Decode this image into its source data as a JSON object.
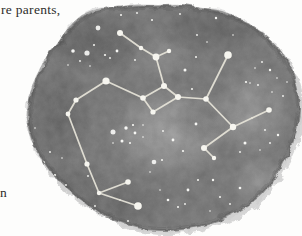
{
  "page": {
    "background": "#fdfdfc",
    "ink_color": "#2e2d2b",
    "text_fragments": [
      {
        "id": "top-margin-text",
        "text": "re parents,"
      },
      {
        "id": "left-margin-text",
        "text": "n"
      }
    ]
  },
  "illustration": {
    "type": "constellation-watercolor-wash",
    "canvas": {
      "width": 302,
      "height": 236
    },
    "wash": {
      "base_color": "#7a7a7a",
      "edge_color": "#5a5a5a",
      "dark_color": "#474747",
      "light_color": "#b9b9b9",
      "underwash_color": "#cccccc",
      "outline": [
        [
          57,
          44
        ],
        [
          68,
          28
        ],
        [
          82,
          15
        ],
        [
          97,
          9
        ],
        [
          115,
          7
        ],
        [
          135,
          5
        ],
        [
          158,
          5
        ],
        [
          180,
          5
        ],
        [
          203,
          8
        ],
        [
          222,
          11
        ],
        [
          238,
          18
        ],
        [
          254,
          28
        ],
        [
          270,
          41
        ],
        [
          282,
          55
        ],
        [
          291,
          71
        ],
        [
          296,
          88
        ],
        [
          298,
          106
        ],
        [
          296,
          124
        ],
        [
          291,
          142
        ],
        [
          284,
          158
        ],
        [
          274,
          176
        ],
        [
          261,
          192
        ],
        [
          245,
          205
        ],
        [
          228,
          214
        ],
        [
          209,
          221
        ],
        [
          188,
          226
        ],
        [
          166,
          228
        ],
        [
          145,
          227
        ],
        [
          124,
          222
        ],
        [
          104,
          214
        ],
        [
          86,
          203
        ],
        [
          68,
          189
        ],
        [
          52,
          173
        ],
        [
          40,
          156
        ],
        [
          31,
          139
        ],
        [
          27,
          122
        ],
        [
          28,
          104
        ],
        [
          32,
          86
        ],
        [
          40,
          68
        ],
        [
          48,
          54
        ]
      ],
      "shading": [
        {
          "kind": "light",
          "x": 168,
          "y": 132,
          "rx": 62,
          "ry": 46,
          "opacity": 0.75
        },
        {
          "kind": "light",
          "x": 252,
          "y": 112,
          "rx": 40,
          "ry": 48,
          "opacity": 0.55
        },
        {
          "kind": "light",
          "x": 160,
          "y": 58,
          "rx": 36,
          "ry": 24,
          "opacity": 0.3
        },
        {
          "kind": "light",
          "x": 262,
          "y": 182,
          "rx": 32,
          "ry": 26,
          "opacity": 0.5
        },
        {
          "kind": "dark",
          "x": 95,
          "y": 42,
          "rx": 58,
          "ry": 34,
          "opacity": 0.5
        },
        {
          "kind": "dark",
          "x": 58,
          "y": 115,
          "rx": 36,
          "ry": 55,
          "opacity": 0.4
        },
        {
          "kind": "dark",
          "x": 213,
          "y": 28,
          "rx": 60,
          "ry": 26,
          "opacity": 0.45
        },
        {
          "kind": "dark",
          "x": 118,
          "y": 205,
          "rx": 55,
          "ry": 26,
          "opacity": 0.35
        },
        {
          "kind": "dark",
          "x": 196,
          "y": 122,
          "rx": 26,
          "ry": 20,
          "opacity": 0.28
        },
        {
          "kind": "dark",
          "x": 70,
          "y": 185,
          "rx": 40,
          "ry": 25,
          "opacity": 0.3
        }
      ]
    },
    "constellation": {
      "line_color": "#e8e5da",
      "line_width": 1.7,
      "node_color": "#f6f5ef",
      "nodes": [
        {
          "id": "F",
          "x": 120,
          "y": 33,
          "r": 3.0
        },
        {
          "id": "F2",
          "x": 141,
          "y": 48,
          "r": 2.2
        },
        {
          "id": "E",
          "x": 156,
          "y": 57,
          "r": 3.4
        },
        {
          "id": "E2",
          "x": 169,
          "y": 51,
          "r": 2.2
        },
        {
          "id": "D",
          "x": 164,
          "y": 86,
          "r": 3.0
        },
        {
          "id": "A",
          "x": 143,
          "y": 98,
          "r": 2.8
        },
        {
          "id": "B",
          "x": 153,
          "y": 112,
          "r": 2.6
        },
        {
          "id": "C",
          "x": 178,
          "y": 97,
          "r": 3.0
        },
        {
          "id": "G",
          "x": 106,
          "y": 81,
          "r": 3.6
        },
        {
          "id": "G2",
          "x": 76,
          "y": 100,
          "r": 2.6
        },
        {
          "id": "G3",
          "x": 68,
          "y": 114,
          "r": 2.4
        },
        {
          "id": "G4",
          "x": 87,
          "y": 164,
          "r": 2.6
        },
        {
          "id": "V",
          "x": 99,
          "y": 193,
          "r": 2.2
        },
        {
          "id": "V1",
          "x": 128,
          "y": 182,
          "r": 2.8
        },
        {
          "id": "V2",
          "x": 138,
          "y": 206,
          "r": 3.8
        },
        {
          "id": "I",
          "x": 206,
          "y": 99,
          "r": 2.8
        },
        {
          "id": "H",
          "x": 228,
          "y": 55,
          "r": 3.8
        },
        {
          "id": "K",
          "x": 233,
          "y": 127,
          "r": 3.2
        },
        {
          "id": "L",
          "x": 269,
          "y": 110,
          "r": 2.8
        },
        {
          "id": "M",
          "x": 204,
          "y": 148,
          "r": 3.0
        },
        {
          "id": "N",
          "x": 214,
          "y": 158,
          "r": 2.2
        }
      ],
      "edges": [
        [
          "F",
          "F2"
        ],
        [
          "F2",
          "E"
        ],
        [
          "E",
          "E2"
        ],
        [
          "E",
          "D"
        ],
        [
          "D",
          "A"
        ],
        [
          "A",
          "B"
        ],
        [
          "B",
          "C"
        ],
        [
          "C",
          "D"
        ],
        [
          "A",
          "G"
        ],
        [
          "G",
          "G2"
        ],
        [
          "G2",
          "G3"
        ],
        [
          "G3",
          "G4"
        ],
        [
          "G4",
          "V"
        ],
        [
          "V",
          "V1"
        ],
        [
          "V",
          "V2"
        ],
        [
          "C",
          "I"
        ],
        [
          "I",
          "H"
        ],
        [
          "I",
          "K"
        ],
        [
          "K",
          "L"
        ],
        [
          "K",
          "M"
        ],
        [
          "M",
          "N"
        ]
      ]
    },
    "star_color": "#fdfdfa",
    "stars": [
      [
        98,
        28,
        2.4
      ],
      [
        73,
        51,
        1.8
      ],
      [
        87,
        53,
        2.6
      ],
      [
        94,
        45,
        1.0
      ],
      [
        105,
        55,
        1.1
      ],
      [
        110,
        58,
        0.9
      ],
      [
        117,
        51,
        1.4
      ],
      [
        80,
        61,
        0.9
      ],
      [
        68,
        65,
        0.8
      ],
      [
        90,
        66,
        0.8
      ],
      [
        135,
        60,
        0.9
      ],
      [
        121,
        15,
        1.0
      ],
      [
        137,
        13,
        0.9
      ],
      [
        152,
        20,
        1.0
      ],
      [
        180,
        14,
        0.9
      ],
      [
        216,
        18,
        1.2
      ],
      [
        197,
        35,
        0.9
      ],
      [
        207,
        42,
        0.8
      ],
      [
        233,
        35,
        0.8
      ],
      [
        185,
        70,
        1.5
      ],
      [
        196,
        57,
        1.0
      ],
      [
        192,
        89,
        1.0
      ],
      [
        262,
        62,
        0.9
      ],
      [
        270,
        70,
        1.2
      ],
      [
        277,
        78,
        0.8
      ],
      [
        255,
        68,
        0.8
      ],
      [
        258,
        85,
        0.9
      ],
      [
        250,
        83,
        0.8
      ],
      [
        272,
        92,
        0.8
      ],
      [
        246,
        82,
        1.1
      ],
      [
        287,
        82,
        0.8
      ],
      [
        283,
        96,
        0.9
      ],
      [
        278,
        135,
        1.2
      ],
      [
        265,
        130,
        0.9
      ],
      [
        270,
        143,
        0.9
      ],
      [
        252,
        118,
        0.8
      ],
      [
        260,
        150,
        0.8
      ],
      [
        245,
        143,
        1.5
      ],
      [
        240,
        152,
        0.9
      ],
      [
        113,
        132,
        2.5
      ],
      [
        126,
        128,
        1.7
      ],
      [
        133,
        125,
        1.1
      ],
      [
        135,
        133,
        1.4
      ],
      [
        122,
        141,
        1.5
      ],
      [
        130,
        143,
        1.0
      ],
      [
        113,
        143,
        0.8
      ],
      [
        143,
        125,
        0.8
      ],
      [
        143,
        137,
        0.8
      ],
      [
        173,
        140,
        1.4
      ],
      [
        183,
        151,
        1.1
      ],
      [
        154,
        162,
        2.3
      ],
      [
        162,
        160,
        1.0
      ],
      [
        150,
        172,
        0.8
      ],
      [
        196,
        124,
        1.4
      ],
      [
        163,
        131,
        0.9
      ],
      [
        25,
        130,
        1.0
      ],
      [
        35,
        128,
        0.8
      ],
      [
        43,
        163,
        2.2
      ],
      [
        33,
        158,
        0.8
      ],
      [
        50,
        152,
        0.9
      ],
      [
        48,
        170,
        1.0
      ],
      [
        55,
        175,
        1.1
      ],
      [
        43,
        178,
        0.8
      ],
      [
        37,
        186,
        0.8
      ],
      [
        62,
        158,
        0.8
      ],
      [
        66,
        185,
        0.9
      ],
      [
        55,
        193,
        0.8
      ],
      [
        88,
        176,
        0.9
      ],
      [
        108,
        218,
        1.3
      ],
      [
        95,
        206,
        0.9
      ],
      [
        128,
        221,
        0.9
      ],
      [
        120,
        200,
        0.8
      ],
      [
        168,
        200,
        1.3
      ],
      [
        178,
        207,
        1.0
      ],
      [
        185,
        204,
        0.9
      ],
      [
        188,
        190,
        1.4
      ],
      [
        160,
        190,
        0.8
      ],
      [
        198,
        180,
        1.0
      ],
      [
        213,
        180,
        1.2
      ],
      [
        220,
        197,
        1.0
      ],
      [
        240,
        188,
        1.3
      ],
      [
        230,
        204,
        0.9
      ],
      [
        210,
        211,
        0.8
      ]
    ]
  }
}
